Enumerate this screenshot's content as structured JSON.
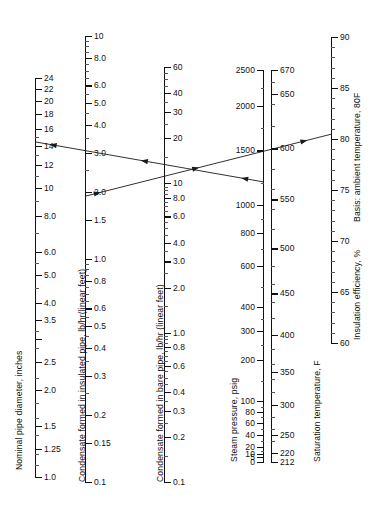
{
  "figure": {
    "type": "nomograph",
    "title": "",
    "background": "#ffffff",
    "line_color": "#1a1a1a"
  },
  "chart_data": {
    "type": "line",
    "xlabel": "",
    "ylabel": "",
    "grid": false,
    "legend": "none",
    "axes": [
      {
        "id": "pipe_diameter",
        "title": "Nominal pipe diameter, inches",
        "scale": "log",
        "label_side": "right",
        "range": [
          1.0,
          24
        ],
        "ticks": [
          "24",
          "22",
          "20",
          "18",
          "16",
          "14",
          "12",
          "10",
          "8.0",
          "6.0",
          "5.0",
          "4.0",
          "3.5",
          "2.5",
          "2.0",
          "1.5",
          "1.25",
          "1.0"
        ],
        "values": [
          24,
          22,
          20,
          18,
          16,
          14,
          12,
          10,
          8.0,
          6.0,
          5.0,
          4.0,
          3.5,
          3.0,
          2.5,
          2.0,
          1.5,
          1.25,
          1.0
        ],
        "unlabeled_values": [
          3.0
        ]
      },
      {
        "id": "condensate_insulated",
        "title": "Condensate formed in insulated pipe, lb/hr(linear feet)",
        "scale": "log",
        "label_side": "right",
        "range": [
          0.1,
          10
        ],
        "ticks": [
          "10",
          "8.0",
          "6.0",
          "5.0",
          "4.0",
          "3.0",
          "2.0",
          "1.5",
          "1.0",
          "0.8",
          "0.6",
          "0.5",
          "0.4",
          "0.3",
          "0.2",
          "0.15",
          "0.1"
        ],
        "values": [
          10,
          8.0,
          6.0,
          5.0,
          4.0,
          3.0,
          2.0,
          1.5,
          1.0,
          0.8,
          0.6,
          0.5,
          0.4,
          0.3,
          0.2,
          0.15,
          0.1
        ]
      },
      {
        "id": "condensate_bare",
        "title": "Condensate formed in bare pipe, lb/hr (linear feet)",
        "scale": "log",
        "label_side": "right",
        "range": [
          0.1,
          60
        ],
        "ticks": [
          "60",
          "40",
          "30",
          "20",
          "10",
          "8.0",
          "6.0",
          "4.0",
          "3.0",
          "2.0",
          "1.0",
          "0.8",
          "0.6",
          "0.4",
          "0.3",
          "0.2",
          "0.1"
        ],
        "values": [
          60,
          40,
          30,
          20,
          10,
          8.0,
          6.0,
          4.0,
          3.0,
          2.0,
          1.0,
          0.8,
          0.6,
          0.4,
          0.3,
          0.2,
          0.1
        ]
      },
      {
        "id": "steam_pressure",
        "title": "Steam pressure, psig",
        "unit": "psig",
        "scale": "nonlinear",
        "label_side": "left",
        "range": [
          0,
          2500
        ],
        "ticks": [
          "2500",
          "2000",
          "1500",
          "1000",
          "800",
          "600",
          "400",
          "300",
          "200",
          "100",
          "80",
          "60",
          "40",
          "20",
          "10",
          "5",
          "0"
        ],
        "values": [
          2500,
          2000,
          1500,
          1000,
          800,
          600,
          400,
          300,
          200,
          100,
          80,
          60,
          40,
          20,
          10,
          5,
          0
        ]
      },
      {
        "id": "saturation_temperature",
        "title": "Saturation temperature, F",
        "unit": "F",
        "scale": "nonlinear",
        "label_side": "right",
        "range": [
          212,
          670
        ],
        "ticks": [
          "670",
          "650",
          "600",
          "550",
          "500",
          "450",
          "400",
          "350",
          "300",
          "250",
          "220",
          "212"
        ],
        "values": [
          670,
          650,
          600,
          550,
          500,
          450,
          400,
          350,
          300,
          250,
          220,
          212
        ]
      },
      {
        "id": "insulation_efficiency",
        "title": "Insulation efficiency, %",
        "subtitle": "Basis: ambient temperature, 80F",
        "unit": "%",
        "scale": "linear",
        "label_side": "right",
        "range": [
          60,
          90
        ],
        "ticks": [
          "90",
          "85",
          "80",
          "75",
          "70",
          "65",
          "60"
        ],
        "values": [
          90,
          85,
          80,
          75,
          70,
          65,
          60
        ]
      }
    ],
    "construction_lines": [
      {
        "name": "line-descending",
        "description": "Reading line running from pipe diameter 14 in down-right to bare pipe ~10 lb/hr and steam pressure ~1000 psig",
        "direction": "left",
        "arrowheads": 3,
        "points": [
          [
            36,
            142
          ],
          [
            264,
            182
          ]
        ]
      },
      {
        "name": "line-ascending",
        "description": "Reading line running from insulated pipe ~1.9 lb/hr up-right through 1500 psig to insulation efficiency 85%",
        "direction": "right",
        "arrowheads": 3,
        "points": [
          [
            86,
            196
          ],
          [
            332,
            134
          ]
        ]
      }
    ]
  },
  "labels": {
    "pipe_diameter_title": "Nominal pipe diameter, inches",
    "insulated_title": "Condensate formed in insulated pipe, lb/hr(linear feet)",
    "bare_title": "Condensate formed in bare pipe, lb/hr (linear feet)",
    "steam_title": "Steam pressure, psig",
    "sat_title": "Saturation temperature, F",
    "eff_title": "Insulation efficiency, %",
    "eff_basis": "Basis: ambient temperature, 80F"
  }
}
